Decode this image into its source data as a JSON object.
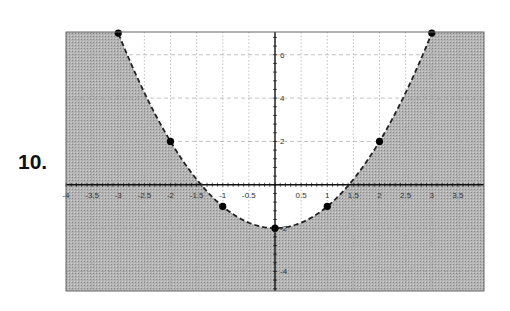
{
  "problem_number": "10.",
  "chart_data": {
    "type": "line",
    "title": "",
    "xlabel": "",
    "ylabel": "",
    "xlim": [
      -4,
      4
    ],
    "ylim": [
      -4.9,
      7.05
    ],
    "grid": true,
    "curve": {
      "equation": "y = x^2 - 2",
      "style": "dashed",
      "shaded_region": "below curve (y < x^2 - 2)"
    },
    "points": [
      {
        "x": -3,
        "y": 7
      },
      {
        "x": -2,
        "y": 2
      },
      {
        "x": -1,
        "y": -1
      },
      {
        "x": 0,
        "y": -2
      },
      {
        "x": 1,
        "y": -1
      },
      {
        "x": 2,
        "y": 2
      },
      {
        "x": 3,
        "y": 7
      }
    ],
    "x_ticks": [
      {
        "value": -4,
        "label": "-4"
      },
      {
        "value": -3.5,
        "label": "-3.5"
      },
      {
        "value": -3,
        "label": "-3"
      },
      {
        "value": -2.5,
        "label": "-2.5"
      },
      {
        "value": -2,
        "label": "-2"
      },
      {
        "value": -1.5,
        "label": "-1.5"
      },
      {
        "value": -1,
        "label": "-1"
      },
      {
        "value": -0.5,
        "label": "-0.5"
      },
      {
        "value": 0.5,
        "label": "0.5"
      },
      {
        "value": 1,
        "label": "1"
      },
      {
        "value": 1.5,
        "label": "1.5"
      },
      {
        "value": 2,
        "label": "2"
      },
      {
        "value": 2.5,
        "label": "2.5"
      },
      {
        "value": 3,
        "label": "3"
      },
      {
        "value": 3.5,
        "label": "3.5"
      }
    ],
    "y_ticks": [
      {
        "value": 6,
        "label": "6"
      },
      {
        "value": 4,
        "label": "4"
      },
      {
        "value": 2,
        "label": "2"
      },
      {
        "value": -2,
        "label": "-2"
      },
      {
        "value": -4,
        "label": "-4"
      }
    ],
    "colors": {
      "shade": "#a9a9a9",
      "curve": "#222222",
      "axis": "#111111",
      "grid": "#9a9a9a",
      "point": "#000000"
    }
  }
}
